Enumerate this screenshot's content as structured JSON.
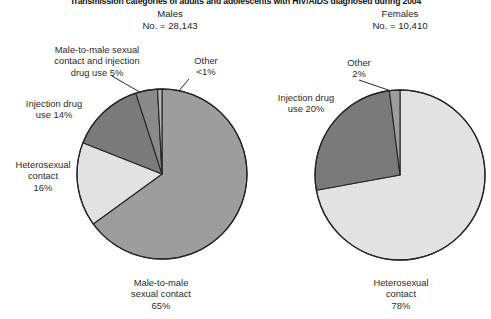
{
  "figure": {
    "title": "Transmission categories of adults and adolescents with HIV/AIDS diagnosed during 2004"
  },
  "panels": {
    "males": {
      "heading": "Males",
      "count": "No. = 28,143"
    },
    "females": {
      "heading": "Females",
      "count": "No. = 10,410"
    }
  },
  "labels": {
    "male_mm_idu": "Male-to-male sexual\ncontact and injection\ndrug use 5%",
    "male_other": "Other\n<1%",
    "male_idu": "Injection drug\nuse 14%",
    "male_het": "Heterosexual\ncontact\n16%",
    "male_mm": "Male-to-male\nsexual contact\n65%",
    "female_other": "Other\n2%",
    "female_idu": "Injection drug\nuse 20%",
    "female_het": "Heterosexual\ncontact\n78%"
  },
  "colors": {
    "slice_medium": "#9d9d9d",
    "slice_light": "#e2e2e2",
    "slice_dark": "#7a7a7a",
    "slice_darker": "#8a8a8a",
    "slice_sliver": "#b5b5b5",
    "outline": "#262626",
    "text": "#2a2a2a",
    "background": "#ffffff"
  },
  "chart_data": [
    {
      "type": "pie",
      "title": "Males",
      "subtitle": "No. = 28,143",
      "total": 28143,
      "start_angle_deg": 0,
      "direction": "clockwise",
      "categories": [
        "Male-to-male sexual contact",
        "Heterosexual contact",
        "Injection drug use",
        "Male-to-male sexual contact and injection drug use",
        "Other"
      ],
      "values": [
        65,
        16,
        14,
        5,
        0.5
      ],
      "value_labels": [
        "65%",
        "16%",
        "14%",
        "5%",
        "<1%"
      ],
      "slice_colors": [
        "#9d9d9d",
        "#e2e2e2",
        "#7a7a7a",
        "#8a8a8a",
        "#b5b5b5"
      ],
      "units": "percent",
      "legend": "none",
      "labels_position": "callout"
    },
    {
      "type": "pie",
      "title": "Females",
      "subtitle": "No. = 10,410",
      "total": 10410,
      "start_angle_deg": 0,
      "direction": "clockwise",
      "categories": [
        "Heterosexual contact",
        "Injection drug use",
        "Other"
      ],
      "values": [
        78,
        20,
        2
      ],
      "value_labels": [
        "78%",
        "20%",
        "2%"
      ],
      "slice_colors": [
        "#e2e2e2",
        "#7a7a7a",
        "#9d9d9d"
      ],
      "units": "percent",
      "legend": "none",
      "labels_position": "callout"
    }
  ]
}
